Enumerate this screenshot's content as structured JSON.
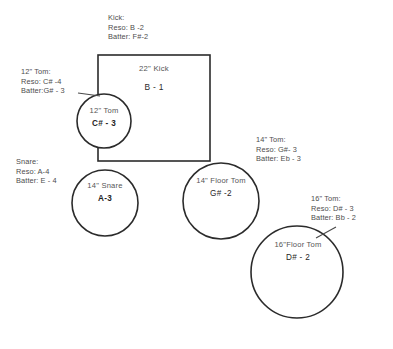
{
  "diagram": {
    "background_color": "#ffffff",
    "stroke_color": "#2b2b2b",
    "text_color": "#4d4d4d"
  },
  "callouts": {
    "kick": {
      "head": "Kick:",
      "reso": "Reso:  B -2",
      "batter": "Batter:  F#-2"
    },
    "tom12": {
      "head": "12\" Tom:",
      "reso": "Reso: C# -4",
      "batter": "Batter:G# - 3"
    },
    "snare": {
      "head": "Snare:",
      "reso": "Reso: A-4",
      "batter": "Batter: E - 4"
    },
    "tom14": {
      "head": "14\" Tom:",
      "reso": "Reso: G#- 3",
      "batter": "Batter: Eb - 3"
    },
    "tom16": {
      "head": "16\" Tom:",
      "reso": "Reso: D# - 3",
      "batter": "Batter: Bb - 2"
    }
  },
  "drums": {
    "kick": {
      "size": "22\"  Kick",
      "note": "B - 1",
      "shape": "rectangle"
    },
    "tom12": {
      "size": "12\" Tom",
      "note": "C# - 3",
      "shape": "circle"
    },
    "snare": {
      "size": "14\"  Snare",
      "note": "A-3",
      "shape": "circle"
    },
    "floor_tom14": {
      "size": "14\" Floor Tom",
      "note": "G# -2",
      "shape": "circle"
    },
    "floor_tom16": {
      "size": "16\"Floor Tom",
      "note": "D# - 2",
      "shape": "circle"
    }
  }
}
